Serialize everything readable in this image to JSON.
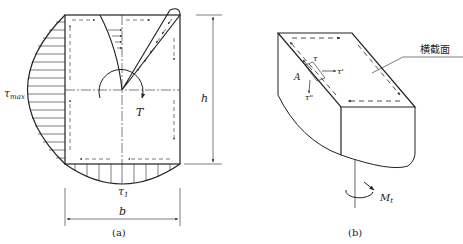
{
  "figure_a": {
    "caption": "(a)",
    "labels": {
      "tau_max": "τ",
      "tau_max_sub": "max",
      "tau_1": "τ",
      "tau_1_sub": "1",
      "torque": "T",
      "width": "b",
      "height": "h"
    }
  },
  "figure_b": {
    "caption": "(b)",
    "labels": {
      "cross_section": "横截面",
      "point": "A",
      "tau": "τ",
      "tau_prime": "τ'",
      "tau_double_prime": "τ\"",
      "moment": "M",
      "moment_sub": "t"
    }
  },
  "colors": {
    "line": "#222222",
    "background": "#ffffff"
  }
}
